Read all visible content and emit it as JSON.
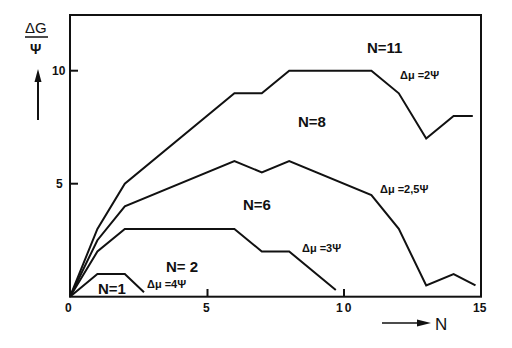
{
  "chart_data": {
    "type": "line",
    "title": "",
    "xlabel": "N",
    "ylabel": "ΔG / Ψ",
    "xlim": [
      0,
      15
    ],
    "ylim": [
      0,
      12.3
    ],
    "x_ticks": [
      0,
      5,
      10,
      15
    ],
    "x_tick_labels": [
      "0",
      "5",
      "10",
      "15"
    ],
    "y_ticks": [
      5,
      10
    ],
    "y_tick_labels": [
      "5",
      "10"
    ],
    "grid": false,
    "legend": null,
    "series": [
      {
        "name": "Δμ = 2Ψ",
        "label_N": "N=11",
        "x": [
          0,
          1,
          2,
          6,
          7,
          8,
          11,
          12,
          13,
          14,
          14.7
        ],
        "y": [
          0,
          3,
          5,
          9,
          9,
          10,
          10,
          9,
          7,
          8,
          8
        ]
      },
      {
        "name": "Δμ = 2,5Ψ",
        "label_N": "N=8",
        "x": [
          0,
          1,
          2,
          6,
          7,
          8,
          11,
          12,
          13,
          14,
          14.8
        ],
        "y": [
          0,
          2.5,
          4,
          6,
          5.5,
          6,
          4.5,
          3,
          0.5,
          1,
          0.5
        ]
      },
      {
        "name": "Δμ = 3Ψ",
        "label_N": "N=6",
        "x": [
          0,
          1,
          2,
          6,
          7,
          8,
          9.7
        ],
        "y": [
          0,
          2,
          3,
          3,
          2,
          2,
          0.3
        ]
      },
      {
        "name": "Δμ = 4Ψ",
        "label_N": "N=2 / N=1",
        "x": [
          0,
          1,
          2,
          2.7
        ],
        "y": [
          0,
          1,
          1,
          0.2
        ]
      }
    ],
    "annotations": [
      {
        "text": "N=11",
        "x": 10.5,
        "y": 11
      },
      {
        "text": "N=8",
        "x": 7.8,
        "y": 8.2
      },
      {
        "text": "N=6",
        "x": 6.2,
        "y": 4
      },
      {
        "text": "N=2",
        "x": 3,
        "y": 1.6
      },
      {
        "text": "N=1",
        "x": 1.2,
        "y": 0.1
      },
      {
        "text": "Δμ=2Ψ",
        "x": 12.1,
        "y": 9.5
      },
      {
        "text": "Δμ=2,5Ψ",
        "x": 11.2,
        "y": 4.6
      },
      {
        "text": "Δμ=3Ψ",
        "x": 8.6,
        "y": 2.5
      },
      {
        "text": "Δμ=4Ψ",
        "x": 2.6,
        "y": 0.6
      }
    ]
  },
  "axes": {
    "y_label_top": "ΔG",
    "y_label_bottom": "Ψ",
    "x_label": "N",
    "x_ticks": [
      "0",
      "5",
      "10",
      "15"
    ],
    "y_ticks": [
      "5",
      "10"
    ]
  },
  "labels": {
    "n11": "N=11",
    "n8": "N=8",
    "n6": "N=6",
    "n2": "N= 2",
    "n1": "N=1",
    "mu2": "Δμ =2Ψ",
    "mu25": "Δμ =2,5Ψ",
    "mu3": "Δμ =3Ψ",
    "mu4": "Δμ =4Ψ"
  }
}
